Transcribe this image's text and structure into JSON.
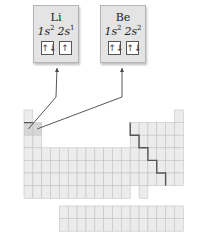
{
  "cards": [
    {
      "symbol": "Li",
      "orbitals": [
        {
          "label_main": "1s",
          "label_sup": "2",
          "arrows": "↑↓"
        },
        {
          "label_main": "2s",
          "label_sup": "1",
          "arrows": "↑"
        }
      ]
    },
    {
      "symbol": "Be",
      "orbitals": [
        {
          "label_main": "1s",
          "label_sup": "2",
          "arrows": "↑↓"
        },
        {
          "label_main": "2s",
          "label_sup": "2",
          "arrows": "↑↓"
        }
      ]
    }
  ],
  "highlighted_elements": [
    "Li",
    "Be"
  ],
  "colors": {
    "cell_fill": "#ececec",
    "cell_border": "#c4c4c4",
    "highlight_fill": "#d6d6d6",
    "staircase": "#555555",
    "arrow": "#444444"
  }
}
